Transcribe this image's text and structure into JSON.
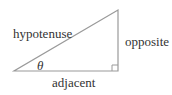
{
  "diagram": {
    "type": "right-triangle",
    "labels": {
      "hypotenuse": "hypotenuse",
      "opposite": "opposite",
      "adjacent": "adjacent",
      "angle": "θ"
    },
    "line_color": "#9a9a9a"
  }
}
